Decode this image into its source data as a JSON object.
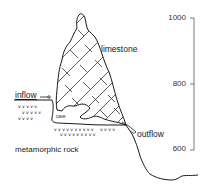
{
  "diagram": {
    "labels": {
      "limestone": "limestone",
      "inflow": "inflow",
      "cave": "cave",
      "outflow": "outflow",
      "metamorphic_rock": "metamorphic rock"
    },
    "elevation_scale": {
      "ticks": [
        "1000",
        "800",
        "600"
      ]
    },
    "colors": {
      "line": "#1a1a1a",
      "background": "#ffffff",
      "axis": "#555555"
    }
  }
}
